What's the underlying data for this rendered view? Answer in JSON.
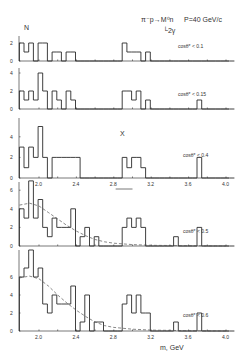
{
  "figure": {
    "y_axis_symbol": "N",
    "reaction_line1": "π⁻p→M⁰n",
    "reaction_line2": "└2γ",
    "beam": "P=40 GeV/c",
    "x_axis_label": "m, GeV",
    "peak_marker": "X"
  },
  "chart_data": {
    "type": "bar",
    "xlabel": "m, GeV",
    "ylabel": "N",
    "xlim": [
      1.78,
      4.05
    ],
    "x_ticks": [
      2.0,
      2.4,
      2.8,
      3.2,
      3.6,
      4.0
    ],
    "bin_width": 0.05,
    "bin_start": 1.79,
    "panels": [
      {
        "label": "cosθ* < 0.1",
        "ylim": [
          0,
          2.5
        ],
        "y_ticks": [
          0,
          2
        ],
        "counts": [
          2,
          1,
          2,
          0,
          2,
          2,
          0,
          1,
          1,
          0,
          1,
          1,
          0,
          0,
          0,
          0,
          0,
          0,
          0,
          0,
          0,
          0,
          2,
          1,
          1,
          1,
          0,
          1,
          0,
          0,
          0,
          0,
          0,
          0,
          0,
          0,
          0,
          0,
          0,
          0,
          0,
          0,
          0,
          0,
          0,
          0
        ]
      },
      {
        "label": "cosθ* < 0.15",
        "ylim": [
          0,
          4.5
        ],
        "y_ticks": [
          0,
          2,
          4
        ],
        "counts": [
          2,
          1,
          2,
          1,
          4,
          2,
          0,
          2,
          1,
          0,
          2,
          1,
          0,
          0,
          0,
          0,
          0,
          0,
          0,
          0,
          0,
          0,
          2,
          2,
          1,
          2,
          0,
          1,
          0,
          0,
          0,
          0,
          0,
          0,
          0,
          0,
          0,
          0,
          1,
          0,
          0,
          0,
          0,
          0,
          0,
          0
        ]
      },
      {
        "label": "cosθ* < 0.4",
        "ylim": [
          0,
          5.5
        ],
        "y_ticks": [
          0,
          2,
          4
        ],
        "counts": [
          3,
          1,
          3,
          2,
          5,
          2,
          0,
          2,
          2,
          2,
          2,
          2,
          2,
          0,
          0,
          0,
          0,
          0,
          0,
          0,
          0,
          0,
          2,
          1,
          2,
          2,
          1,
          0,
          0,
          0,
          0,
          0,
          0,
          0,
          0,
          0,
          0,
          0,
          2,
          0,
          0,
          0,
          0,
          0,
          0,
          0
        ]
      },
      {
        "label": "cosθ* < 0.5",
        "ylim": [
          0,
          7.5
        ],
        "y_ticks": [
          0,
          2,
          4,
          6
        ],
        "counts": [
          4,
          3,
          7,
          3,
          5,
          2,
          1,
          3,
          2,
          2,
          2,
          4,
          0,
          1,
          2,
          0,
          1,
          0,
          0,
          0,
          0,
          0,
          2,
          3,
          2,
          3,
          2,
          0,
          0,
          0,
          0,
          0,
          0,
          1,
          0,
          0,
          0,
          0,
          2,
          0,
          0,
          0,
          0,
          0,
          0,
          0
        ],
        "fit": [
          [
            1.79,
            4.4
          ],
          [
            1.9,
            4.6
          ],
          [
            2.0,
            4.3
          ],
          [
            2.1,
            3.6
          ],
          [
            2.2,
            2.9
          ],
          [
            2.3,
            2.2
          ],
          [
            2.4,
            1.6
          ],
          [
            2.5,
            1.1
          ],
          [
            2.6,
            0.7
          ],
          [
            2.7,
            0.45
          ],
          [
            2.8,
            0.3
          ],
          [
            3.0,
            0.15
          ],
          [
            3.2,
            0.08
          ],
          [
            3.6,
            0.03
          ],
          [
            4.0,
            0.0
          ]
        ]
      },
      {
        "label": "cosθ* < 0.6",
        "ylim": [
          0,
          9.5
        ],
        "y_ticks": [
          0,
          2,
          4,
          6
        ],
        "counts": [
          6,
          7,
          9,
          6,
          7,
          3,
          2,
          4,
          3,
          3,
          3,
          5,
          0,
          1,
          4,
          0,
          1,
          1,
          0,
          0,
          0,
          0,
          3,
          4,
          2,
          4,
          2,
          2,
          0,
          0,
          0,
          0,
          0,
          1,
          0,
          0,
          0,
          0,
          2,
          0,
          0,
          0,
          0,
          0,
          0,
          0
        ],
        "fit": [
          [
            1.79,
            5.9
          ],
          [
            1.9,
            6.1
          ],
          [
            2.0,
            5.8
          ],
          [
            2.1,
            5.0
          ],
          [
            2.2,
            4.0
          ],
          [
            2.3,
            3.1
          ],
          [
            2.4,
            2.3
          ],
          [
            2.5,
            1.6
          ],
          [
            2.6,
            1.0
          ],
          [
            2.7,
            0.6
          ],
          [
            2.8,
            0.4
          ],
          [
            3.0,
            0.2
          ],
          [
            3.2,
            0.1
          ],
          [
            3.6,
            0.03
          ],
          [
            4.0,
            0.0
          ]
        ]
      }
    ]
  },
  "layout": {
    "x0": 39,
    "px_per_gev": 93.5,
    "axis_left": 19,
    "axis_right": 229,
    "panels": [
      {
        "base": 61,
        "ppc": 9.0,
        "top": 36,
        "label_x": 178,
        "label_y": 48
      },
      {
        "base": 109,
        "ppc": 9.0,
        "top": 68,
        "label_x": 178,
        "label_y": 96
      },
      {
        "base": 178,
        "ppc": 10.3,
        "top": 118,
        "label_x": 183,
        "label_y": 157
      },
      {
        "base": 246,
        "ppc": 9.3,
        "top": 182,
        "label_x": 183,
        "label_y": 233
      },
      {
        "base": 331,
        "ppc": 9.0,
        "top": 250,
        "label_x": 183,
        "label_y": 317
      }
    ]
  }
}
